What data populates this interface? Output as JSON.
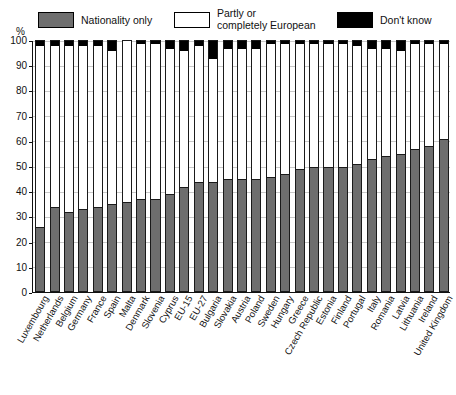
{
  "axis": {
    "y_unit_label": "%",
    "y_ticks": [
      0,
      10,
      20,
      30,
      40,
      50,
      60,
      70,
      80,
      90,
      100
    ]
  },
  "legend": {
    "nationality": "Nationality only",
    "european": "Partly or\ncompletely European",
    "dont_know": "Don't know"
  },
  "colors": {
    "nationality": "#6e6e6e",
    "european": "#ffffff",
    "dont_know": "#000000",
    "outline": "#1a1a1a",
    "grid": "#c9c9c9"
  },
  "chart_data": {
    "type": "bar",
    "subtype": "stacked-100-percent",
    "title": "",
    "xlabel": "",
    "ylabel": "%",
    "ylim": [
      0,
      100
    ],
    "ytick_step": 10,
    "grid": true,
    "legend_position": "top",
    "categories": [
      "Luxembourg",
      "Netherlands",
      "Belgium",
      "Germany",
      "France",
      "Spain",
      "Malta",
      "Denmark",
      "Slovenia",
      "Cyprus",
      "EU-15",
      "EU-27",
      "Bulgaria",
      "Slovakia",
      "Austria",
      "Poland",
      "Sweden",
      "Hungary",
      "Greece",
      "Czech Republic",
      "Estonia",
      "Finland",
      "Portugal",
      "Italy",
      "Romania",
      "Latvia",
      "Lithuania",
      "Ireland",
      "United Kingdom"
    ],
    "series": [
      {
        "name": "Nationality only",
        "color": "#6e6e6e",
        "values": [
          25,
          33,
          31,
          32,
          33,
          34,
          35,
          36,
          36,
          38,
          41,
          43,
          43,
          44,
          44,
          44,
          45,
          46,
          48,
          49,
          49,
          49,
          50,
          52,
          53,
          54,
          56,
          57,
          60
        ]
      },
      {
        "name": "Partly or completely European",
        "color": "#ffffff",
        "values": [
          73,
          65,
          67,
          66,
          65,
          62,
          65,
          63,
          63,
          59,
          55,
          55,
          50,
          53,
          53,
          53,
          54,
          53,
          51,
          50,
          50,
          50,
          48,
          45,
          44,
          42,
          43,
          42,
          39
        ]
      },
      {
        "name": "Don't know",
        "color": "#000000",
        "values": [
          2,
          2,
          2,
          2,
          2,
          4,
          0,
          1,
          1,
          3,
          4,
          2,
          7,
          3,
          3,
          3,
          1,
          1,
          1,
          1,
          1,
          1,
          2,
          3,
          3,
          4,
          1,
          1,
          1
        ]
      }
    ]
  }
}
